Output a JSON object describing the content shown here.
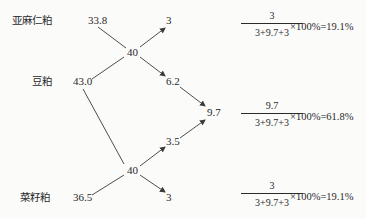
{
  "diagram": {
    "type": "pearson-square-feed-formulation",
    "ingredients": [
      {
        "name": "亚麻仁粕",
        "protein": "33.8"
      },
      {
        "name": "豆粕",
        "protein": "43.0"
      },
      {
        "name": "菜籽粕",
        "protein": "36.5"
      }
    ],
    "targets": [
      "40",
      "40"
    ],
    "differences": {
      "top_right": "3",
      "mid_upper": "6.2",
      "sum": "9.7",
      "mid_lower": "3.5",
      "bottom_right": "3"
    },
    "formulas": [
      {
        "numerator": "3",
        "denominator": "3+9.7+3",
        "result": "×100%=19.1%"
      },
      {
        "numerator": "9.7",
        "denominator": "3+9.7+3",
        "result": "×100%=61.8%"
      },
      {
        "numerator": "3",
        "denominator": "3+9.7+3",
        "result": "×100%=19.1%"
      }
    ]
  },
  "colors": {
    "line": "#3a3a3a",
    "text": "#2a2a2a",
    "background": "#fbfbfa"
  }
}
